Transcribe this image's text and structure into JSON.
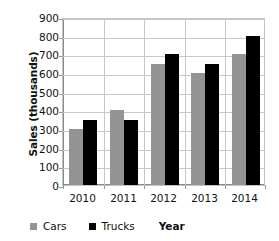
{
  "chart_data": {
    "type": "bar",
    "title": "",
    "subtitle": "",
    "categories": [
      "2010",
      "2011",
      "2012",
      "2013",
      "2014"
    ],
    "series": [
      {
        "name": "Cars",
        "values": [
          300,
          400,
          650,
          600,
          700
        ],
        "color": "#949494"
      },
      {
        "name": "Trucks",
        "values": [
          350,
          350,
          700,
          650,
          800
        ],
        "color": "#000000"
      }
    ],
    "xlabel": "Year",
    "ylabel": "Sales (thousands)",
    "ylim": [
      0,
      900
    ],
    "ytick_step": 100,
    "yticks": [
      "900",
      "800",
      "700",
      "600",
      "500",
      "400",
      "300",
      "200",
      "100",
      "0"
    ],
    "grid": {
      "horizontal": true,
      "vertical": true,
      "color": "#c8c8c8"
    },
    "legend": {
      "position": "bottom-left",
      "entries": [
        {
          "label": "Cars",
          "swatch_color": "#949494"
        },
        {
          "label": "Trucks",
          "swatch_color": "#000000"
        }
      ]
    },
    "plot_border_color": "#c4c4c4",
    "axis_color": "#8a8a8a",
    "text_color": "#111111"
  }
}
